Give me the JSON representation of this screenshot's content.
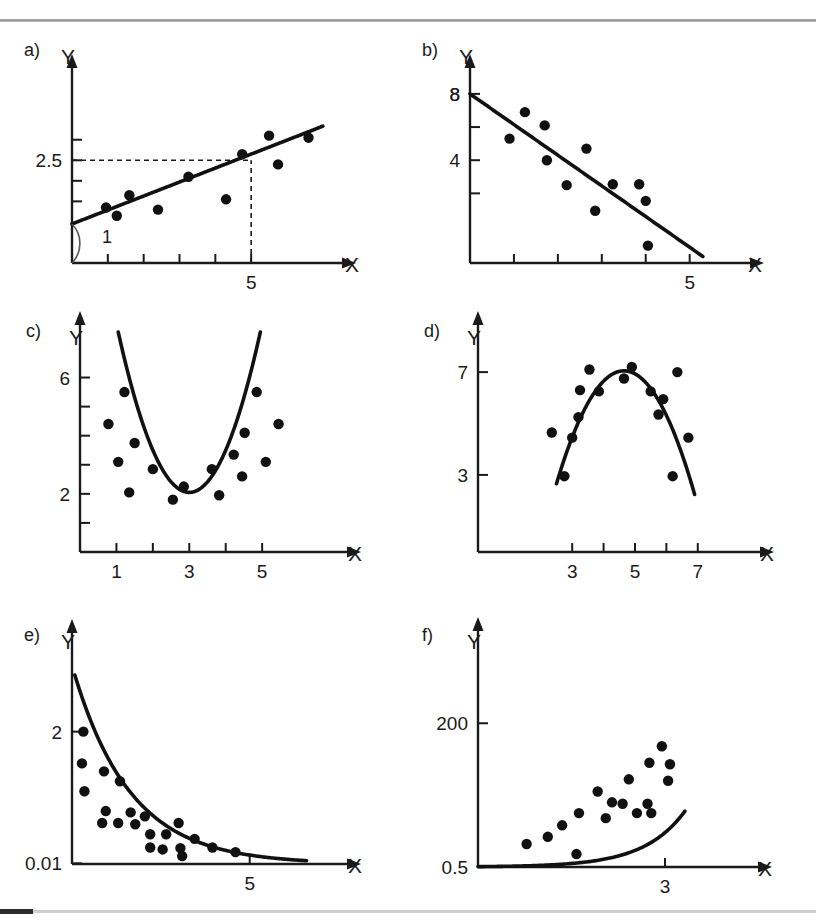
{
  "figure": {
    "panel_count": 6,
    "axis_x_name": "X",
    "axis_y_name": "Y",
    "point_color": "#111111",
    "curve_color": "#111111",
    "axis_color": "#1a1a1a",
    "background": "#ffffff",
    "rule_color_top": "#8e8e8e",
    "rule_color_bottom": "#cfcfcf",
    "rule_cap_color": "#2b2b2b"
  },
  "panels": [
    {
      "id": "a",
      "label": "a)",
      "type": "linear-increasing"
    },
    {
      "id": "b",
      "label": "b)",
      "type": "linear-decreasing"
    },
    {
      "id": "c",
      "label": "c)",
      "type": "quadratic-convex"
    },
    {
      "id": "d",
      "label": "d)",
      "type": "quadratic-concave"
    },
    {
      "id": "e",
      "label": "e)",
      "type": "exponential-decay"
    },
    {
      "id": "f",
      "label": "f)",
      "type": "exponential-growth"
    }
  ],
  "chart_data": [
    {
      "panel": "a",
      "type": "scatter",
      "title": "a)",
      "xlabel": "X",
      "ylabel": "Y",
      "xlim": [
        0,
        7.2
      ],
      "ylim": [
        0,
        4.6
      ],
      "grid": false,
      "legend": null,
      "xticks": [
        1,
        2,
        3,
        4,
        5
      ],
      "xticklabels": [
        "",
        "",
        "",
        "",
        "5"
      ],
      "yticks": [
        1.5,
        2.0,
        2.5,
        3.0
      ],
      "yticklabels": [
        "",
        "",
        "2.5",
        ""
      ],
      "points": [
        [
          0.95,
          1.35
        ],
        [
          1.25,
          1.15
        ],
        [
          1.6,
          1.65
        ],
        [
          2.4,
          1.3
        ],
        [
          3.25,
          2.1
        ],
        [
          4.3,
          1.55
        ],
        [
          4.75,
          2.65
        ],
        [
          5.5,
          3.1
        ],
        [
          5.75,
          2.4
        ],
        [
          6.6,
          3.05
        ]
      ],
      "fit": {
        "form": "linear",
        "intercept": 0.95,
        "slope": 0.34,
        "x_from": 0.0,
        "x_to": 7.0
      },
      "annotations": [
        {
          "text": "1",
          "x": 0.55,
          "y": 0.55,
          "kind": "slope-angle-label"
        },
        {
          "text": "2.5",
          "kind": "y-guide-value",
          "value": 2.5
        },
        {
          "text": "5",
          "kind": "x-guide-value",
          "value": 5
        }
      ],
      "guides": [
        {
          "kind": "dashed-horizontal",
          "y": 2.5,
          "x_from": 0,
          "x_to": 5
        },
        {
          "kind": "dashed-vertical",
          "x": 5,
          "y_from": 0,
          "y_to": 2.5
        }
      ]
    },
    {
      "panel": "b",
      "type": "scatter",
      "title": "b)",
      "xlabel": "X",
      "ylabel": "Y",
      "xlim": [
        0,
        6.1
      ],
      "ylim": [
        -2.2,
        9.2
      ],
      "grid": false,
      "legend": null,
      "xticks": [
        1,
        2,
        3,
        4,
        5
      ],
      "xticklabels": [
        "",
        "",
        "",
        "",
        "5"
      ],
      "yticks": [
        2,
        4,
        6,
        8
      ],
      "yticklabels": [
        "",
        "4",
        "",
        "8"
      ],
      "points": [
        [
          0.9,
          5.3
        ],
        [
          1.25,
          6.9
        ],
        [
          1.7,
          6.1
        ],
        [
          1.75,
          4.0
        ],
        [
          2.2,
          2.5
        ],
        [
          2.65,
          4.7
        ],
        [
          2.85,
          0.95
        ],
        [
          3.25,
          2.55
        ],
        [
          3.85,
          2.55
        ],
        [
          4.0,
          1.55
        ],
        [
          4.05,
          -1.15
        ]
      ],
      "fit": {
        "form": "linear",
        "intercept": 8.0,
        "slope": -1.85,
        "x_from": 0.0,
        "x_to": 5.3
      },
      "annotations": [
        {
          "text": "8",
          "kind": "y-intercept-value",
          "value": 8
        }
      ],
      "guides": []
    },
    {
      "panel": "c",
      "type": "scatter",
      "title": "c)",
      "xlabel": "X",
      "ylabel": "Y",
      "xlim": [
        0,
        7.0
      ],
      "ylim": [
        0,
        7.6
      ],
      "grid": false,
      "legend": null,
      "xticks": [
        1,
        2,
        3,
        4,
        5
      ],
      "xticklabels": [
        "1",
        "",
        "3",
        "",
        "5"
      ],
      "yticks": [
        1,
        2,
        3,
        4,
        5,
        6
      ],
      "yticklabels": [
        "",
        "2",
        "",
        "",
        "",
        "6"
      ],
      "points": [
        [
          0.78,
          4.4
        ],
        [
          1.05,
          3.1
        ],
        [
          1.22,
          5.5
        ],
        [
          1.35,
          2.05
        ],
        [
          1.5,
          3.75
        ],
        [
          2.0,
          2.85
        ],
        [
          2.55,
          1.8
        ],
        [
          2.85,
          2.25
        ],
        [
          3.62,
          2.85
        ],
        [
          3.82,
          1.95
        ],
        [
          4.22,
          3.35
        ],
        [
          4.45,
          2.6
        ],
        [
          4.52,
          4.1
        ],
        [
          4.85,
          5.5
        ],
        [
          5.1,
          3.1
        ],
        [
          5.45,
          4.4
        ]
      ],
      "fit": {
        "form": "quadratic",
        "vertex_x": 3.0,
        "vertex_y": 2.05,
        "a": 1.45,
        "x_from": 1.05,
        "x_to": 4.95
      },
      "annotations": [],
      "guides": []
    },
    {
      "panel": "d",
      "type": "scatter",
      "title": "d)",
      "xlabel": "X",
      "ylabel": "Y",
      "xlim": [
        0,
        8.6
      ],
      "ylim": [
        0,
        8.6
      ],
      "grid": false,
      "legend": null,
      "xticks": [
        3,
        4,
        5,
        6,
        7
      ],
      "xticklabels": [
        "3",
        "",
        "5",
        "",
        "7"
      ],
      "yticks": [
        3,
        7
      ],
      "yticklabels": [
        "3",
        "7"
      ],
      "points": [
        [
          2.35,
          4.65
        ],
        [
          2.75,
          2.95
        ],
        [
          3.0,
          4.45
        ],
        [
          3.2,
          5.25
        ],
        [
          3.25,
          6.3
        ],
        [
          3.55,
          7.1
        ],
        [
          3.85,
          6.25
        ],
        [
          4.65,
          6.75
        ],
        [
          4.9,
          7.2
        ],
        [
          5.5,
          6.25
        ],
        [
          5.75,
          5.35
        ],
        [
          5.9,
          5.95
        ],
        [
          6.2,
          2.95
        ],
        [
          6.35,
          7.0
        ],
        [
          6.7,
          4.45
        ]
      ],
      "fit": {
        "form": "quadratic",
        "vertex_x": 4.65,
        "vertex_y": 7.05,
        "a": -0.95,
        "x_from": 2.5,
        "x_to": 6.9
      },
      "annotations": [],
      "guides": []
    },
    {
      "panel": "e",
      "type": "scatter",
      "title": "e)",
      "xlabel": "X",
      "ylabel": "Y",
      "xlim": [
        0,
        7.4
      ],
      "ylim": [
        0,
        3.4
      ],
      "grid": false,
      "legend": null,
      "xticks": [
        5
      ],
      "xticklabels": [
        "5"
      ],
      "yticks": [
        0.01,
        2
      ],
      "yticklabels": [
        "0.01",
        "2"
      ],
      "points": [
        [
          0.32,
          2.0
        ],
        [
          0.28,
          1.52
        ],
        [
          0.35,
          1.1
        ],
        [
          0.9,
          1.4
        ],
        [
          0.95,
          0.8
        ],
        [
          0.85,
          0.62
        ],
        [
          1.35,
          1.25
        ],
        [
          1.3,
          0.62
        ],
        [
          1.65,
          0.78
        ],
        [
          1.78,
          0.6
        ],
        [
          2.05,
          0.72
        ],
        [
          2.2,
          0.45
        ],
        [
          2.2,
          0.25
        ],
        [
          2.55,
          0.22
        ],
        [
          2.65,
          0.45
        ],
        [
          3.0,
          0.62
        ],
        [
          3.05,
          0.24
        ],
        [
          3.1,
          0.12
        ],
        [
          3.45,
          0.38
        ],
        [
          3.95,
          0.25
        ],
        [
          4.6,
          0.18
        ]
      ],
      "fit": {
        "form": "exponential-decay",
        "scale": 3.0,
        "rate": 0.62,
        "x_from": 0.08,
        "x_to": 6.6
      },
      "annotations": [],
      "guides": []
    },
    {
      "panel": "f",
      "type": "scatter",
      "title": "f)",
      "xlabel": "X",
      "ylabel": "Y",
      "xlim": [
        0,
        4.3
      ],
      "ylim": [
        0,
        320
      ],
      "grid": false,
      "legend": null,
      "xticks": [
        3
      ],
      "xticklabels": [
        "3"
      ],
      "yticks": [
        0.5,
        200
      ],
      "yticklabels": [
        "0.5",
        "200"
      ],
      "points": [
        [
          0.78,
          32
        ],
        [
          1.12,
          42
        ],
        [
          1.35,
          58
        ],
        [
          1.58,
          18
        ],
        [
          1.62,
          75
        ],
        [
          1.92,
          105
        ],
        [
          2.05,
          68
        ],
        [
          2.15,
          90
        ],
        [
          2.32,
          88
        ],
        [
          2.42,
          122
        ],
        [
          2.55,
          75
        ],
        [
          2.72,
          88
        ],
        [
          2.75,
          145
        ],
        [
          2.78,
          75
        ],
        [
          2.95,
          168
        ],
        [
          3.05,
          120
        ],
        [
          3.08,
          143
        ]
      ],
      "fit": {
        "form": "exponential-growth",
        "scale": 0.5,
        "rate": 1.52,
        "x_from": 0.0,
        "x_to": 3.32
      },
      "annotations": [],
      "guides": []
    }
  ]
}
